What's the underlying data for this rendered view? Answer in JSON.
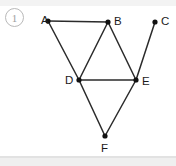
{
  "problem": {
    "number": "1"
  },
  "colors": {
    "edge": "#2b2b2b",
    "vertex": "#111111",
    "label": "#1b1b1b",
    "number_ring": "#b9b9b9",
    "background": "#ffffff"
  },
  "diagram": {
    "type": "graph",
    "title": "",
    "vertices": [
      {
        "id": "A",
        "label": "A",
        "x": 48,
        "y": 21,
        "label_x": 41,
        "label_y": 24
      },
      {
        "id": "B",
        "label": "B",
        "x": 108,
        "y": 22,
        "label_x": 114,
        "label_y": 25
      },
      {
        "id": "C",
        "label": "C",
        "x": 155,
        "y": 22,
        "label_x": 161,
        "label_y": 25
      },
      {
        "id": "D",
        "label": "D",
        "x": 79,
        "y": 80,
        "label_x": 65,
        "label_y": 84
      },
      {
        "id": "E",
        "label": "E",
        "x": 136,
        "y": 80,
        "label_x": 142,
        "label_y": 85
      },
      {
        "id": "F",
        "label": "F",
        "x": 105,
        "y": 136,
        "label_x": 101,
        "label_y": 152
      }
    ],
    "edges": [
      {
        "from": "A",
        "to": "B"
      },
      {
        "from": "A",
        "to": "D"
      },
      {
        "from": "B",
        "to": "D"
      },
      {
        "from": "B",
        "to": "E"
      },
      {
        "from": "C",
        "to": "E"
      },
      {
        "from": "D",
        "to": "E"
      },
      {
        "from": "D",
        "to": "F"
      },
      {
        "from": "E",
        "to": "F"
      }
    ]
  }
}
